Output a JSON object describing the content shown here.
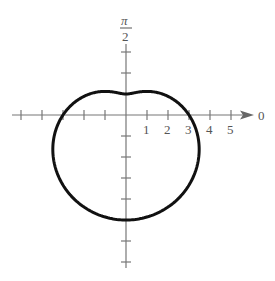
{
  "chart_data": {
    "type": "polar",
    "equation": "r = 3 - 2 sin θ",
    "curve": "limaçon (dimpled)",
    "axis_labels": {
      "polar_axis": "0",
      "vertical_axis_numerator": "π",
      "vertical_axis_denominator": "2"
    },
    "tick_labels": [
      "1",
      "2",
      "3",
      "4",
      "5"
    ],
    "radial_range": [
      -5,
      5
    ],
    "key_points": [
      {
        "theta": "0",
        "r": 3
      },
      {
        "theta": "π/2",
        "r": 1
      },
      {
        "theta": "π",
        "r": 3
      },
      {
        "theta": "3π/2",
        "r": 5
      }
    ],
    "colors": {
      "curve": "#111111",
      "axes": "#777777",
      "labels": "#555555"
    }
  }
}
